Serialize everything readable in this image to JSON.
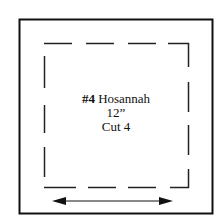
{
  "block": {
    "number": "#4",
    "name": "Hosannah",
    "size": "12”",
    "cut": "Cut 4"
  },
  "diagram": {
    "outer_square": {
      "x": 19,
      "y": 19,
      "w": 193,
      "h": 194
    },
    "inner_dashed_square": {
      "x": 44,
      "y": 43,
      "w": 144,
      "h": 144
    },
    "grain_arrow": {
      "x1": 52,
      "x2": 173,
      "y": 201,
      "direction": "double-headed horizontal"
    },
    "line_color": "#111111"
  }
}
